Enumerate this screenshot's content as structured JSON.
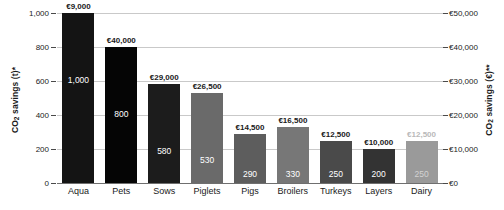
{
  "chart_data": {
    "type": "bar",
    "title": "",
    "xlabel": "",
    "ylabel": "CO2 savings (t)*",
    "ylabel_right": "CO2 savings (€)**",
    "categories": [
      "Aqua",
      "Pets",
      "Sows",
      "Piglets",
      "Pigs",
      "Broilers",
      "Turkeys",
      "Layers",
      "Dairy"
    ],
    "values": [
      1000,
      800,
      580,
      530,
      290,
      330,
      250,
      200,
      250
    ],
    "value_labels": [
      "1,000",
      "800",
      "580",
      "530",
      "290",
      "330",
      "250",
      "200",
      "250"
    ],
    "euro_values": [
      9000,
      40000,
      29000,
      26500,
      14500,
      16500,
      12500,
      10000,
      12500
    ],
    "euro_labels": [
      "€9,000",
      "€40,000",
      "€29,000",
      "€26,500",
      "€14,500",
      "€16,500",
      "€12,500",
      "€10,000",
      "€12,500"
    ],
    "bar_colors": [
      "#141414",
      "#050505",
      "#1c1c1c",
      "#6a6a6a",
      "#5d5d5d",
      "#777777",
      "#4a4a4a",
      "#333333",
      "#9a9a9a"
    ],
    "dimmed": [
      false,
      false,
      false,
      false,
      false,
      false,
      false,
      false,
      true
    ],
    "ylim": [
      0,
      1000
    ],
    "yticks": [
      0,
      200,
      400,
      600,
      800,
      1000
    ],
    "ytick_labels": [
      "0",
      "200",
      "400",
      "600",
      "800",
      "1,000"
    ],
    "ylim_right": [
      0,
      50000
    ],
    "yticks_right": [
      0,
      10000,
      20000,
      30000,
      40000,
      50000
    ],
    "ytick_labels_right": [
      "€0",
      "€10,000",
      "€20,000",
      "€30,000",
      "€40,000",
      "€50,000"
    ],
    "grid": true,
    "legend": "none"
  },
  "axes": {
    "left_title_main": "CO",
    "left_title_sub": "2",
    "left_title_rest": " savings (t)*",
    "right_title_main": "CO",
    "right_title_sub": "2",
    "right_title_rest": " savings (€)**"
  }
}
